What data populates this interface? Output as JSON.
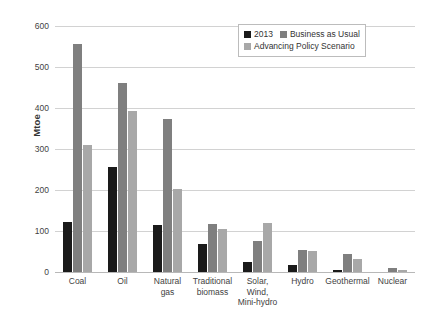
{
  "chart_data": {
    "type": "bar",
    "title": "",
    "xlabel": "",
    "ylabel": "Mtoe",
    "ylim": [
      0,
      600
    ],
    "ytick_step": 100,
    "yticks": [
      600,
      500,
      400,
      300,
      200,
      100,
      0
    ],
    "grid": "horizontal",
    "legend_position": "top-right",
    "categories": [
      "Coal",
      "Oil",
      "Natural gas",
      "Traditional biomass",
      "Solar, Wind, Mini-hydro",
      "Hydro",
      "Geothermal",
      "Nuclear"
    ],
    "category_label_lines": [
      [
        "Coal"
      ],
      [
        "Oil"
      ],
      [
        "Natural",
        "gas"
      ],
      [
        "Traditional",
        "biomass"
      ],
      [
        "Solar,",
        "Wind,",
        "Mini-hydro"
      ],
      [
        "Hydro"
      ],
      [
        "Geothermal"
      ],
      [
        "Nuclear"
      ]
    ],
    "series": [
      {
        "name": "2013",
        "color": "#1a1a1a",
        "values": [
          122,
          255,
          115,
          68,
          25,
          18,
          5,
          0
        ]
      },
      {
        "name": "Business as Usual",
        "color": "#7f7f7f",
        "values": [
          555,
          460,
          373,
          117,
          75,
          54,
          45,
          9
        ]
      },
      {
        "name": "Advancing Policy Scenario",
        "color": "#a8a8a8",
        "values": [
          310,
          392,
          202,
          104,
          120,
          52,
          32,
          6
        ]
      }
    ]
  },
  "legend": {
    "rows": [
      [
        "2013",
        "Business as Usual"
      ],
      [
        "Advancing Policy Scenario"
      ]
    ]
  }
}
